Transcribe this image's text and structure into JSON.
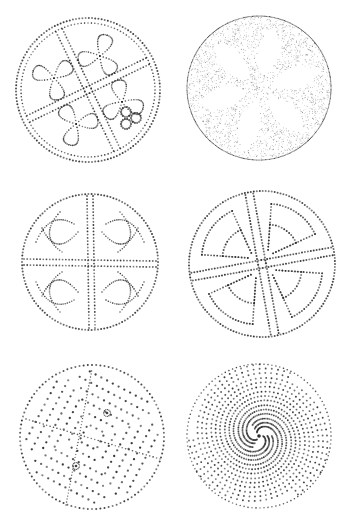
{
  "plate": {
    "width": 351,
    "height": 522,
    "background": "#ffffff",
    "ink": "#2a2a2a",
    "figures": [
      {
        "id": "disc-1",
        "name": "triquetra-knot-disc",
        "cx": 88,
        "cy": 90,
        "r": 72,
        "style": "dotted",
        "motif": "knotwork-quadrants"
      },
      {
        "id": "disc-2",
        "name": "six-petal-rosette-disc",
        "cx": 259,
        "cy": 88,
        "r": 72,
        "style": "stippled",
        "motif": "petal-rosette",
        "petals": 6
      },
      {
        "id": "disc-3",
        "name": "cross-knotwork-disc",
        "cx": 90,
        "cy": 262,
        "r": 68,
        "style": "dotted",
        "motif": "cross-with-knots"
      },
      {
        "id": "disc-4",
        "name": "step-cross-disc",
        "cx": 262,
        "cy": 264,
        "r": 73,
        "style": "dotted",
        "motif": "offset-cross-with-triangles"
      },
      {
        "id": "disc-5",
        "name": "dotted-quadrant-disc",
        "cx": 92,
        "cy": 437,
        "r": 72,
        "style": "dotted",
        "motif": "quadrant-rows-with-rings"
      },
      {
        "id": "disc-6",
        "name": "spiral-dot-disc",
        "cx": 259,
        "cy": 436,
        "r": 72,
        "style": "dotted",
        "motif": "triple-spiral"
      }
    ]
  }
}
